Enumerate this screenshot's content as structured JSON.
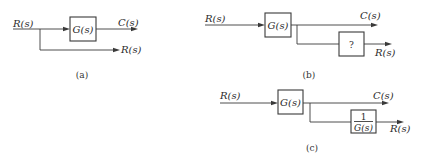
{
  "colors": {
    "stroke": "#3a3a3a",
    "text": "#2a2a2a",
    "background": "#ffffff"
  },
  "diagrams": {
    "a": {
      "caption": "(a)",
      "input_label": "R(s)",
      "block_label": "G(s)",
      "output_label": "C(s)",
      "branch_output_label": "R(s)"
    },
    "b": {
      "caption": "(b)",
      "input_label": "R(s)",
      "block_label": "G(s)",
      "output_label": "C(s)",
      "unknown_block_label": "?",
      "branch_output_label": "R(s)"
    },
    "c": {
      "caption": "(c)",
      "input_label": "R(s)",
      "block_label": "G(s)",
      "output_label": "C(s)",
      "inverse_block_numerator": "1",
      "inverse_block_denominator": "G(s)",
      "branch_output_label": "R(s)"
    }
  }
}
